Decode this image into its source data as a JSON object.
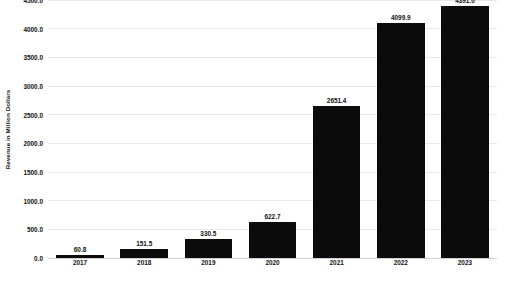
{
  "chart_data": {
    "type": "bar",
    "title": "",
    "xlabel": "",
    "ylabel": "Revenue in Million Dollars",
    "categories": [
      "2017",
      "2018",
      "2019",
      "2020",
      "2021",
      "2022",
      "2023"
    ],
    "values": [
      60.8,
      151.5,
      330.5,
      622.7,
      2651.4,
      4099.9,
      4391.0
    ],
    "value_labels": [
      "60.8",
      "151.5",
      "330.5",
      "622.7",
      "2651.4",
      "4099.9",
      "4391.0"
    ],
    "ylim": [
      0,
      4500
    ],
    "yticks": [
      0,
      500,
      1000,
      1500,
      2000,
      2500,
      3000,
      3500,
      4000,
      4500
    ],
    "ytick_labels": [
      "0.0",
      "500.0",
      "1000.0",
      "1500.0",
      "2000.0",
      "2500.0",
      "3000.0",
      "3500.0",
      "4000.0",
      "4500.0"
    ],
    "grid": true,
    "legend": false,
    "bar_color": "#0b0b0b",
    "grid_color": "#e8e8e8",
    "background_color": "#ffffff"
  }
}
